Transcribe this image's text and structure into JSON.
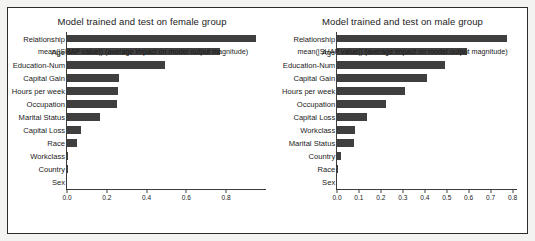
{
  "figure": {
    "background": "#ffffff",
    "page_background": "#f3f3f1",
    "bar_color": "#3f3f3f",
    "axis_color": "#3c3c3c"
  },
  "chart_data": [
    {
      "type": "bar",
      "orientation": "horizontal",
      "title": "Model trained and test on female group",
      "xlabel": "mean(|SHAP value|) (average impact on model output magnitude)",
      "ylabel": "",
      "categories": [
        "Relationship",
        "Age",
        "Education-Num",
        "Capital Gain",
        "Hours per week",
        "Occupation",
        "Marital Status",
        "Capital Loss",
        "Race",
        "Workclass",
        "Country",
        "Sex"
      ],
      "values": [
        0.95,
        0.77,
        0.49,
        0.26,
        0.255,
        0.25,
        0.165,
        0.07,
        0.05,
        0.006,
        0.003,
        0.0
      ],
      "xlim": [
        0.0,
        1.0
      ],
      "xticks": [
        0.0,
        0.2,
        0.4,
        0.6,
        0.8
      ],
      "xticklabels": [
        "0.0",
        "0.2",
        "0.4",
        "0.6",
        "0.8"
      ],
      "grid": false,
      "legend": null
    },
    {
      "type": "bar",
      "orientation": "horizontal",
      "title": "Model trained and test on male group",
      "xlabel": "mean(|SHAP value|) (average impact on model output magnitude)",
      "ylabel": "",
      "categories": [
        "Relationship",
        "Age",
        "Education-Num",
        "Capital Gain",
        "Hours per week",
        "Occupation",
        "Capital Loss",
        "Workclass",
        "Marital Status",
        "Country",
        "Race",
        "Sex"
      ],
      "values": [
        0.775,
        0.59,
        0.49,
        0.41,
        0.31,
        0.225,
        0.135,
        0.08,
        0.078,
        0.02,
        0.005,
        0.0
      ],
      "xlim": [
        0.0,
        0.82
      ],
      "xticks": [
        0.0,
        0.1,
        0.2,
        0.3,
        0.4,
        0.5,
        0.6,
        0.7,
        0.8
      ],
      "xticklabels": [
        "0.0",
        "0.1",
        "0.2",
        "0.3",
        "0.4",
        "0.5",
        "0.6",
        "0.7",
        "0.8"
      ],
      "grid": false,
      "legend": null
    }
  ]
}
